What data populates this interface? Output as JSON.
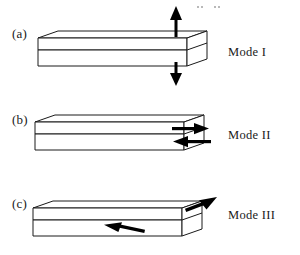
{
  "figure": {
    "background_color": "#ffffff",
    "line_color": "#1a1a1a",
    "arrow_color": "#000000",
    "width": 300,
    "height": 255
  },
  "panels": [
    {
      "key": "a",
      "label": "(a)",
      "mode_label": "Mode I",
      "mode_name": "opening",
      "arrows": [
        {
          "name": "up-arrow",
          "direction": "up",
          "position": "above-block-right"
        },
        {
          "name": "down-arrow",
          "direction": "down",
          "position": "below-block-right"
        }
      ]
    },
    {
      "key": "b",
      "label": "(b)",
      "mode_label": "Mode II",
      "mode_name": "sliding-shear",
      "arrows": [
        {
          "name": "right-arrow",
          "direction": "right",
          "position": "upper-half-right-face"
        },
        {
          "name": "left-arrow",
          "direction": "left",
          "position": "lower-half-right-face"
        }
      ]
    },
    {
      "key": "c",
      "label": "(c)",
      "mode_label": "Mode III",
      "mode_name": "tearing",
      "arrows": [
        {
          "name": "up-right-diagonal-arrow",
          "direction": "up-right",
          "position": "upper-half-right-edge"
        },
        {
          "name": "down-left-diagonal-arrow",
          "direction": "down-left",
          "position": "lower-half-front-face"
        }
      ]
    }
  ]
}
